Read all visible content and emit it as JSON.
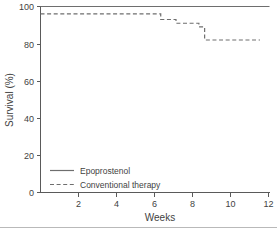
{
  "chart_data": {
    "type": "line",
    "title": "",
    "subtitle": "",
    "xlabel": "Weeks",
    "ylabel": "Survival (%)",
    "xlim": [
      0,
      12
    ],
    "ylim": [
      0,
      100
    ],
    "xticks": [
      2,
      4,
      6,
      8,
      10,
      12
    ],
    "xtick_labels": [
      "2",
      "4",
      "6",
      "8",
      "10",
      "12"
    ],
    "yticks": [
      0,
      20,
      40,
      60,
      80,
      100
    ],
    "ytick_labels": [
      "0",
      "20",
      "40",
      "60",
      "80",
      "100"
    ],
    "grid": false,
    "legend_position": "lower-left",
    "step_style": "post",
    "series": [
      {
        "name": "Epoprostenol",
        "linestyle": "solid",
        "color": "#6e6e6e",
        "x": [
          0.0,
          12.0
        ],
        "values": [
          100.0,
          100.0
        ]
      },
      {
        "name": "Conventional therapy",
        "linestyle": "dashed",
        "color": "#6e6e6e",
        "x": [
          0.0,
          2.9,
          6.3,
          7.1,
          8.3,
          8.6,
          11.5
        ],
        "values": [
          96.0,
          96.0,
          93.0,
          91.0,
          89.0,
          82.0,
          82.0
        ]
      }
    ]
  },
  "legend": {
    "entries": [
      {
        "label": "Epoprostenol",
        "linestyle": "solid"
      },
      {
        "label": "Conventional therapy",
        "linestyle": "dashed"
      }
    ]
  },
  "colors": {
    "line": "#6e6e6e",
    "axis": "#5a5a5a",
    "text": "#3f3f3f",
    "background": "#ffffff"
  }
}
